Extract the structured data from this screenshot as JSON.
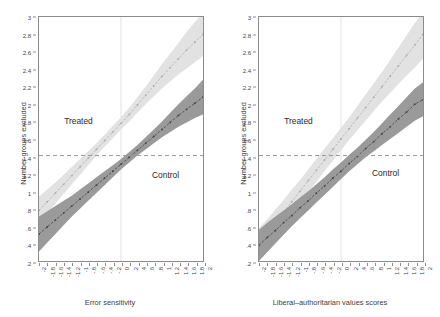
{
  "chart_data": [
    {
      "type": "line",
      "panel": "left",
      "title": "",
      "xlabel": "Error sensitivity",
      "ylabel": "Number groups excluded",
      "xlim": [
        -2,
        2
      ],
      "ylim": [
        0.2,
        3.0
      ],
      "xticks": [
        "-2",
        "-1.8",
        "-1.6",
        "-1.4",
        "-1.2",
        "-1",
        "-.8",
        "-.6",
        "-.4",
        "-.2",
        "0",
        ".2",
        ".4",
        ".6",
        ".8",
        "1",
        "1.2",
        "1.4",
        "1.6",
        "1.8",
        "2"
      ],
      "xtickvalues": [
        -2,
        -1.8,
        -1.6,
        -1.4,
        -1.2,
        -1,
        -0.8,
        -0.6,
        -0.4,
        -0.2,
        0,
        0.2,
        0.4,
        0.6,
        0.8,
        1,
        1.2,
        1.4,
        1.6,
        1.8,
        2
      ],
      "yticks": [
        ".2",
        ".4",
        ".6",
        ".8",
        "1",
        "1.2",
        "1.4",
        "1.6",
        "1.8",
        "2",
        "2.2",
        "2.4",
        "2.6",
        "2.8",
        "3"
      ],
      "ytickvalues": [
        0.2,
        0.4,
        0.6,
        0.8,
        1.0,
        1.2,
        1.4,
        1.6,
        1.8,
        2.0,
        2.2,
        2.4,
        2.6,
        2.8,
        3.0
      ],
      "grid": false,
      "legend_position": "in-plot annotations",
      "reference_lines": {
        "horizontal": {
          "y": 1.41,
          "style": "dashed",
          "color": "#999999"
        },
        "vertical": {
          "x": 0.0,
          "style": "solid",
          "color": "#e3e3e3"
        }
      },
      "annotations": [
        {
          "text": "Treated",
          "x": -1.05,
          "y": 1.82
        },
        {
          "text": "Control",
          "x": 1.05,
          "y": 1.2
        }
      ],
      "series": [
        {
          "name": "Treated",
          "color": "#cfcfcf",
          "band_color": "#e2e2e2",
          "x": [
            -2,
            -1.8,
            -1.6,
            -1.4,
            -1.2,
            -1,
            -0.8,
            -0.6,
            -0.4,
            -0.2,
            0,
            0.2,
            0.4,
            0.6,
            0.8,
            1,
            1.2,
            1.4,
            1.6,
            1.8,
            2
          ],
          "values": [
            0.78,
            0.88,
            0.98,
            1.08,
            1.18,
            1.28,
            1.38,
            1.48,
            1.58,
            1.68,
            1.78,
            1.88,
            1.99,
            2.1,
            2.21,
            2.32,
            2.42,
            2.52,
            2.62,
            2.71,
            2.8
          ],
          "lower": [
            0.62,
            0.74,
            0.86,
            0.97,
            1.08,
            1.19,
            1.3,
            1.41,
            1.51,
            1.61,
            1.71,
            1.8,
            1.9,
            2.0,
            2.09,
            2.18,
            2.26,
            2.34,
            2.41,
            2.48,
            2.55
          ],
          "upper": [
            0.94,
            1.02,
            1.1,
            1.19,
            1.28,
            1.37,
            1.46,
            1.55,
            1.65,
            1.75,
            1.85,
            1.96,
            2.08,
            2.2,
            2.33,
            2.46,
            2.58,
            2.7,
            2.83,
            2.94,
            3.05
          ]
        },
        {
          "name": "Control",
          "color": "#6e6e6e",
          "band_color": "#9a9a9a",
          "x": [
            -2,
            -1.8,
            -1.6,
            -1.4,
            -1.2,
            -1,
            -0.8,
            -0.6,
            -0.4,
            -0.2,
            0,
            0.2,
            0.4,
            0.6,
            0.8,
            1,
            1.2,
            1.4,
            1.6,
            1.8,
            2
          ],
          "values": [
            0.51,
            0.59,
            0.67,
            0.75,
            0.83,
            0.91,
            0.99,
            1.07,
            1.15,
            1.23,
            1.31,
            1.39,
            1.47,
            1.55,
            1.63,
            1.71,
            1.79,
            1.87,
            1.94,
            2.01,
            2.08
          ],
          "lower": [
            0.31,
            0.41,
            0.51,
            0.61,
            0.71,
            0.8,
            0.89,
            0.98,
            1.07,
            1.16,
            1.25,
            1.33,
            1.41,
            1.48,
            1.55,
            1.62,
            1.68,
            1.74,
            1.79,
            1.84,
            1.88
          ],
          "upper": [
            0.71,
            0.77,
            0.83,
            0.89,
            0.95,
            1.02,
            1.09,
            1.16,
            1.23,
            1.3,
            1.37,
            1.45,
            1.53,
            1.62,
            1.71,
            1.8,
            1.9,
            2.0,
            2.09,
            2.18,
            2.28
          ]
        }
      ]
    },
    {
      "type": "line",
      "panel": "right",
      "title": "",
      "xlabel": "Liberal–authoritarian values scores",
      "ylabel": "Number groups excluded",
      "xlim": [
        -2,
        2
      ],
      "ylim": [
        0.2,
        3.0
      ],
      "xticks": [
        "-2",
        "-1.8",
        "-1.6",
        "-1.4",
        "-1.2",
        "-1",
        "-.8",
        "-.6",
        "-.4",
        "-.2",
        "0",
        ".2",
        ".4",
        ".6",
        ".8",
        "1",
        "1.2",
        "1.4",
        "1.6",
        "1.8",
        "2"
      ],
      "xtickvalues": [
        -2,
        -1.8,
        -1.6,
        -1.4,
        -1.2,
        -1,
        -0.8,
        -0.6,
        -0.4,
        -0.2,
        0,
        0.2,
        0.4,
        0.6,
        0.8,
        1,
        1.2,
        1.4,
        1.6,
        1.8,
        2
      ],
      "yticks": [
        ".2",
        ".4",
        ".6",
        ".8",
        "1",
        "1.2",
        "1.4",
        "1.6",
        "1.8",
        "2",
        "2.2",
        "2.4",
        "2.6",
        "2.8",
        "3"
      ],
      "ytickvalues": [
        0.2,
        0.4,
        0.6,
        0.8,
        1.0,
        1.2,
        1.4,
        1.6,
        1.8,
        2.0,
        2.2,
        2.4,
        2.6,
        2.8,
        3.0
      ],
      "grid": false,
      "legend_position": "in-plot annotations",
      "reference_lines": {
        "horizontal": {
          "y": 1.41,
          "style": "dashed",
          "color": "#999999"
        },
        "vertical": {
          "x": 0.0,
          "style": "solid",
          "color": "#e3e3e3"
        }
      },
      "annotations": [
        {
          "text": "Treated",
          "x": -1.05,
          "y": 1.82
        },
        {
          "text": "Control",
          "x": 1.05,
          "y": 1.22
        }
      ],
      "series": [
        {
          "name": "Treated",
          "color": "#cfcfcf",
          "band_color": "#e2e2e2",
          "x": [
            -2,
            -1.8,
            -1.6,
            -1.4,
            -1.2,
            -1,
            -0.8,
            -0.6,
            -0.4,
            -0.2,
            0,
            0.2,
            0.4,
            0.6,
            0.8,
            1,
            1.2,
            1.4,
            1.6,
            1.8,
            2
          ],
          "values": [
            0.4,
            0.52,
            0.64,
            0.76,
            0.88,
            1.0,
            1.12,
            1.24,
            1.36,
            1.48,
            1.6,
            1.72,
            1.84,
            1.96,
            2.08,
            2.2,
            2.32,
            2.44,
            2.56,
            2.68,
            2.8
          ],
          "lower": [
            0.22,
            0.36,
            0.49,
            0.62,
            0.74,
            0.87,
            0.99,
            1.11,
            1.23,
            1.35,
            1.47,
            1.59,
            1.7,
            1.81,
            1.92,
            2.03,
            2.13,
            2.23,
            2.33,
            2.42,
            2.52
          ],
          "upper": [
            0.58,
            0.68,
            0.79,
            0.9,
            1.02,
            1.13,
            1.25,
            1.37,
            1.49,
            1.61,
            1.73,
            1.85,
            1.98,
            2.11,
            2.24,
            2.37,
            2.51,
            2.65,
            2.79,
            2.93,
            3.05
          ]
        },
        {
          "name": "Control",
          "color": "#6e6e6e",
          "band_color": "#9a9a9a",
          "x": [
            -2,
            -1.8,
            -1.6,
            -1.4,
            -1.2,
            -1,
            -0.8,
            -0.6,
            -0.4,
            -0.2,
            0,
            0.2,
            0.4,
            0.6,
            0.8,
            1,
            1.2,
            1.4,
            1.6,
            1.8,
            2
          ],
          "values": [
            0.38,
            0.47,
            0.55,
            0.64,
            0.72,
            0.81,
            0.89,
            0.98,
            1.06,
            1.15,
            1.23,
            1.32,
            1.4,
            1.49,
            1.57,
            1.66,
            1.74,
            1.83,
            1.91,
            2.0,
            2.05
          ],
          "lower": [
            0.2,
            0.3,
            0.4,
            0.5,
            0.6,
            0.69,
            0.78,
            0.87,
            0.96,
            1.05,
            1.14,
            1.23,
            1.31,
            1.39,
            1.46,
            1.53,
            1.6,
            1.67,
            1.74,
            1.81,
            1.86
          ],
          "upper": [
            0.56,
            0.64,
            0.71,
            0.78,
            0.85,
            0.93,
            1.0,
            1.08,
            1.16,
            1.25,
            1.33,
            1.42,
            1.5,
            1.59,
            1.68,
            1.78,
            1.88,
            1.98,
            2.08,
            2.18,
            2.25
          ]
        }
      ]
    }
  ],
  "panels": {
    "left": {
      "xlabel": "Error sensitivity",
      "ylabel": "Number groups excluded",
      "treated_label": "Treated",
      "control_label": "Control"
    },
    "right": {
      "xlabel": "Liberal–authoritarian values scores",
      "ylabel": "Number groups excluded",
      "treated_label": "Treated",
      "control_label": "Control"
    }
  },
  "colors": {
    "treated_line": "#cfcfcf",
    "treated_band": "#e2e2e2",
    "control_line": "#6e6e6e",
    "control_band": "#9a9a9a",
    "axis": "#8c8c8c",
    "reference_dash": "#999999",
    "reference_vertical": "#e3e3e3",
    "text": "#3d3d3d",
    "background": "#ffffff"
  }
}
